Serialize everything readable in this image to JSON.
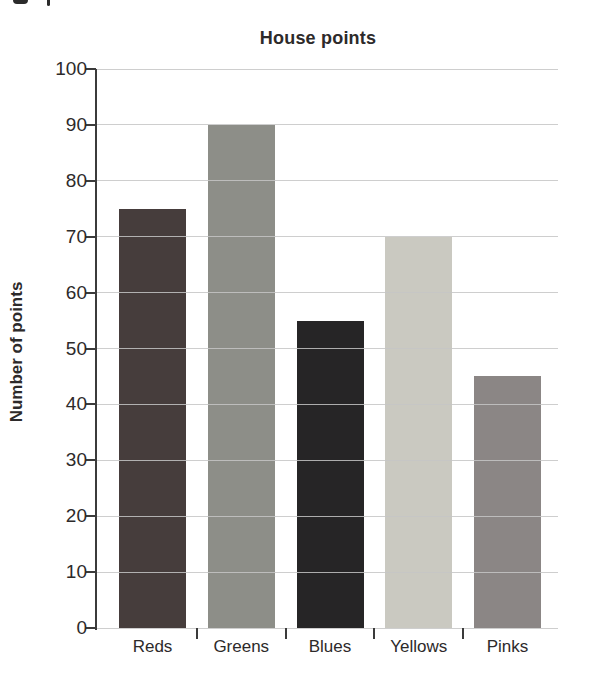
{
  "chart_data": {
    "type": "bar",
    "title": "House points",
    "xlabel": "",
    "ylabel": "Number of points",
    "categories": [
      "Reds",
      "Greens",
      "Blues",
      "Yellows",
      "Pinks"
    ],
    "values": [
      75,
      90,
      55,
      70,
      45
    ],
    "bar_colors": [
      "#463d3c",
      "#8d8e88",
      "#262526",
      "#cac9c1",
      "#8b8685"
    ],
    "ylim": [
      0,
      100
    ],
    "yticks": [
      0,
      10,
      20,
      30,
      40,
      50,
      60,
      70,
      80,
      90,
      100
    ],
    "grid": true,
    "gridlines_over_bars": true,
    "legend": "none",
    "colors": {
      "gridline": "#c6c6c6",
      "axis": "#3b3b3b",
      "tick": "#3b3b3b",
      "text": "#2d2a2a",
      "background": "#ffffff"
    }
  }
}
